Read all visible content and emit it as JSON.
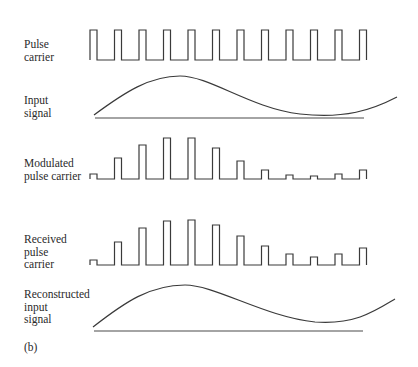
{
  "labels": {
    "pulse_carrier": "Pulse\ncarrier",
    "input_signal": "Input\nsignal",
    "modulated": "Modulated\npulse carrier",
    "received": "Received\npulse\ncarrier",
    "reconstructed": "Reconstructed\ninput\nsignal",
    "panel": "(b)"
  },
  "geometry": {
    "pulse_start_x": 90,
    "pulse_period": 24.5,
    "pulse_width": 7,
    "pulse_count": 12,
    "end_x": 364
  },
  "pulse_carrier": {
    "top": 30,
    "bottom": 60
  },
  "modulated": {
    "baseline": 179,
    "tops": [
      174,
      158,
      145,
      138,
      138,
      148,
      161,
      170,
      175,
      176,
      174,
      170
    ]
  },
  "received": {
    "baseline": 265,
    "tops": [
      260,
      242,
      228,
      221,
      220,
      225,
      236,
      246,
      254,
      257,
      254,
      248
    ]
  },
  "input_signal": {
    "baseline_y": 118,
    "curve": "M94,115 C125,92 150,76 180,76 C210,76 250,108 300,114 C345,119 372,110 397,97"
  },
  "reconstructed": {
    "baseline_y": 331,
    "curve": "M93,327 C125,302 150,285 185,285 C215,285 265,317 315,322 C355,325 375,311 395,299"
  },
  "colors": {
    "stroke": "#3a3a3a",
    "text": "#2a2a2a"
  }
}
